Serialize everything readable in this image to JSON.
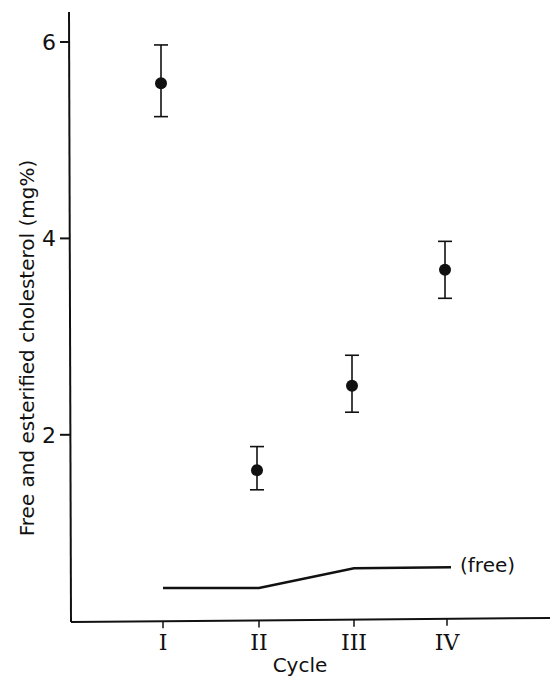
{
  "chart_data": {
    "type": "scatter",
    "title": "",
    "xlabel": "Cycle",
    "ylabel": "Free and esterified cholesterol (mg%)",
    "categories": [
      "I",
      "II",
      "III",
      "IV"
    ],
    "yticks": [
      "2",
      "4",
      "6"
    ],
    "ylim": [
      0.1,
      6.3
    ],
    "grid": false,
    "legend": "none",
    "series": [
      {
        "name": "Free and esterified cholesterol (mean ± error)",
        "marker": "filled-circle",
        "values": [
          5.58,
          1.64,
          2.5,
          3.68
        ],
        "error_upper": [
          5.97,
          1.88,
          2.81,
          3.97
        ],
        "error_lower": [
          5.24,
          1.44,
          2.23,
          3.39
        ]
      },
      {
        "name": "free",
        "style": "line",
        "values": [
          0.44,
          0.44,
          0.64,
          0.65
        ],
        "annotation": "(free)"
      }
    ]
  },
  "labels": {
    "free_annotation": "(free)"
  }
}
